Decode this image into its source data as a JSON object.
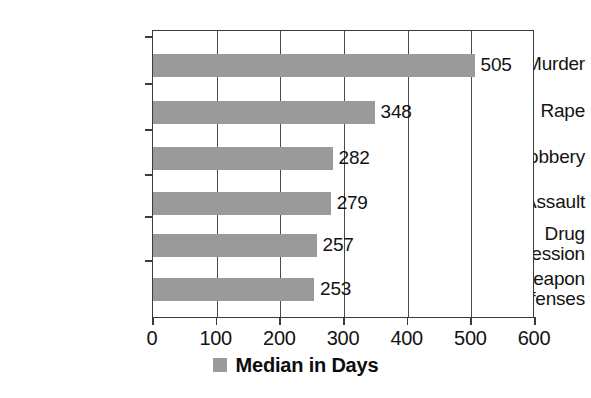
{
  "chart_data": {
    "type": "bar",
    "orientation": "horizontal",
    "title": "",
    "subtitle": "",
    "xlabel": "",
    "ylabel": "",
    "xlim": [
      0,
      600
    ],
    "xticks": [
      "0",
      "100",
      "200",
      "300",
      "400",
      "500",
      "600"
    ],
    "grid": "vertical",
    "legend_position": "bottom-center",
    "categories": [
      "Murder",
      "Rape",
      "Robbery",
      "Assault",
      "Drug Possession",
      "Weapon Offenses"
    ],
    "category_lines": [
      [
        "Murder"
      ],
      [
        "Rape"
      ],
      [
        "Robbery"
      ],
      [
        "Assault"
      ],
      [
        "Drug",
        "Possession"
      ],
      [
        "Weapon",
        "Offenses"
      ]
    ],
    "series": [
      {
        "name": "Median in Days",
        "color": "#9a9a9a",
        "values": [
          505,
          348,
          282,
          279,
          257,
          253
        ]
      }
    ],
    "value_labels": [
      "505",
      "348",
      "282",
      "279",
      "257",
      "253"
    ]
  },
  "legend": {
    "swatch_name": "legend-color-swatch",
    "label": "Median in Days",
    "color": "#9a9a9a"
  },
  "colors": {
    "bar": "#9a9a9a",
    "axis": "#3b3b3b",
    "grid": "#4a4a4a",
    "text": "#131313",
    "background": "#ffffff"
  }
}
